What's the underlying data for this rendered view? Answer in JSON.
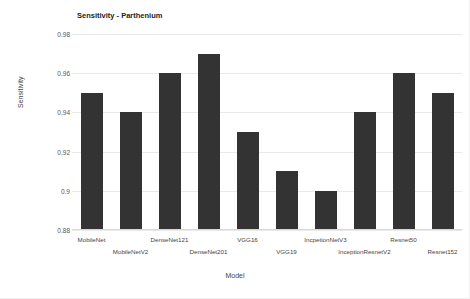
{
  "chart_data": {
    "type": "bar",
    "title": "Sensitivity - Parthenium",
    "xlabel": "Model",
    "ylabel": "Sensitivity",
    "categories": [
      "MobileNet",
      "MobileNetV2",
      "DenseNet121",
      "DenseNet201",
      "VGG16",
      "VGG19",
      "IncpetionNetV3",
      "InceptionResnetV2",
      "Resnet50",
      "Resnet152"
    ],
    "values": [
      0.95,
      0.94,
      0.96,
      0.97,
      0.93,
      0.91,
      0.9,
      0.94,
      0.96,
      0.95
    ],
    "ylim": [
      0.88,
      0.98
    ],
    "yticks": [
      0.88,
      0.9,
      0.92,
      0.94,
      0.96,
      0.98
    ],
    "ytick_labels": [
      "0.88",
      "0.9",
      "0.92",
      "0.94",
      "0.96",
      "0.98"
    ],
    "grid": true,
    "legend": "none",
    "bar_color": "#333333",
    "grid_color": "#e9e9e9",
    "background": "#ffffff"
  }
}
